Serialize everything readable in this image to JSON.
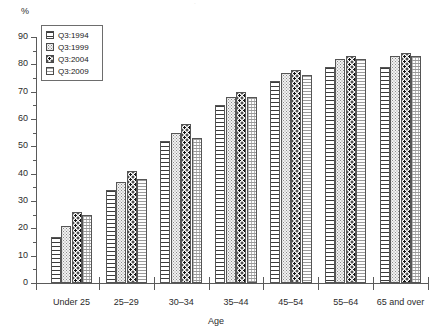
{
  "chart_data": {
    "type": "bar",
    "title": "",
    "xlabel": "Age",
    "ylabel": "%",
    "ylim": [
      0,
      90
    ],
    "ytick_step": 10,
    "yminor_step": 5,
    "grid": false,
    "legend_position": "top-left",
    "categories": [
      "Under 25",
      "25–29",
      "30–34",
      "35–44",
      "45–54",
      "55–64",
      "65 and over"
    ],
    "ytick_labels": [
      "0",
      "10",
      "20",
      "30",
      "40",
      "50",
      "60",
      "70",
      "80",
      "90"
    ],
    "series": [
      {
        "name": "Q3:1994",
        "pattern": "horizontal-lines",
        "values": [
          17,
          34,
          52,
          65,
          74,
          79,
          79
        ]
      },
      {
        "name": "Q3:1999",
        "pattern": "light-dots",
        "values": [
          21,
          37,
          55,
          68,
          77,
          82,
          83
        ]
      },
      {
        "name": "Q3:2004",
        "pattern": "dark-dots",
        "values": [
          26,
          41,
          58,
          70,
          78,
          83,
          84
        ]
      },
      {
        "name": "Q3:2009",
        "pattern": "fine-grid",
        "values": [
          25,
          38,
          53,
          68,
          76,
          82,
          83
        ]
      }
    ]
  },
  "legend": {
    "items": [
      {
        "label": "Q3:1994"
      },
      {
        "label": "Q3:1999"
      },
      {
        "label": "Q3:2004"
      },
      {
        "label": "Q3:2009"
      }
    ]
  },
  "axis": {
    "y_unit": "%",
    "x_title": "Age"
  },
  "artifacts": {
    "top_mark": "·"
  },
  "colors": {
    "axis": "#5a5a5a",
    "bar_outline": "#555555",
    "text": "#1a1a1a",
    "background": "#ffffff"
  }
}
